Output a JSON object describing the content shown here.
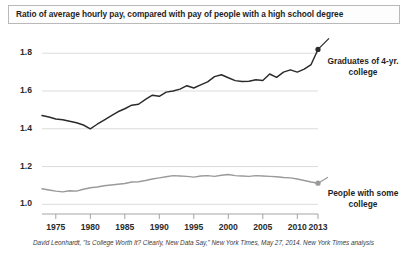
{
  "title": "Ratio of average hourly pay, compared with pay of people with a high school degree",
  "caption": "David Leonhardt, \"Is College Worth It? Clearly, New Data Say,\" New York Times, May 27, 2014. New York Times analysis",
  "annotations": {
    "graduates": "Graduates of 4-yr. college",
    "some_college": "People with some college"
  },
  "colors": {
    "graduates_line": "#2a2a2a",
    "some_college_line": "#9a9a9a",
    "gridline": "#d8d8d8",
    "axis": "#9a9a9a",
    "title_border": "#b9b9b9",
    "text": "#1f1f1f"
  },
  "chart_data": {
    "type": "line",
    "title": "Ratio of average hourly pay, compared with pay of people with a high school degree",
    "xlabel": "",
    "ylabel": "",
    "xlim": [
      1973,
      2013
    ],
    "ylim": [
      0.97,
      1.87
    ],
    "yticks": [
      "1.0",
      "1.2",
      "1.4",
      "1.6",
      "1.8"
    ],
    "ytick_values": [
      1.0,
      1.2,
      1.4,
      1.6,
      1.8
    ],
    "xticks": [
      "1975",
      "1980",
      "1985",
      "1990",
      "1995",
      "2000",
      "2005",
      "2010",
      "2013"
    ],
    "xtick_values": [
      1975,
      1980,
      1985,
      1990,
      1995,
      2000,
      2005,
      2010,
      2013
    ],
    "grid": "horizontal",
    "legend": "inline-right-annotations",
    "x": [
      1973,
      1974,
      1975,
      1976,
      1977,
      1978,
      1979,
      1980,
      1981,
      1982,
      1983,
      1984,
      1985,
      1986,
      1987,
      1988,
      1989,
      1990,
      1991,
      1992,
      1993,
      1994,
      1995,
      1996,
      1997,
      1998,
      1999,
      2000,
      2001,
      2002,
      2003,
      2004,
      2005,
      2006,
      2007,
      2008,
      2009,
      2010,
      2011,
      2012,
      2013
    ],
    "series": [
      {
        "name": "Graduates of 4-yr. college",
        "color": "#2a2a2a",
        "end_marker": true,
        "values": [
          1.47,
          1.462,
          1.452,
          1.448,
          1.44,
          1.432,
          1.42,
          1.4,
          1.424,
          1.446,
          1.468,
          1.49,
          1.506,
          1.525,
          1.53,
          1.556,
          1.578,
          1.572,
          1.594,
          1.6,
          1.61,
          1.628,
          1.616,
          1.632,
          1.648,
          1.676,
          1.686,
          1.67,
          1.655,
          1.65,
          1.652,
          1.66,
          1.656,
          1.69,
          1.672,
          1.7,
          1.712,
          1.7,
          1.716,
          1.74,
          1.82
        ]
      },
      {
        "name": "People with some college",
        "color": "#9a9a9a",
        "end_marker": true,
        "values": [
          1.082,
          1.076,
          1.07,
          1.066,
          1.072,
          1.07,
          1.08,
          1.088,
          1.092,
          1.098,
          1.102,
          1.106,
          1.11,
          1.118,
          1.12,
          1.126,
          1.134,
          1.14,
          1.146,
          1.152,
          1.15,
          1.148,
          1.144,
          1.15,
          1.152,
          1.148,
          1.154,
          1.158,
          1.152,
          1.15,
          1.148,
          1.152,
          1.15,
          1.148,
          1.146,
          1.142,
          1.14,
          1.134,
          1.126,
          1.118,
          1.112
        ]
      }
    ]
  }
}
